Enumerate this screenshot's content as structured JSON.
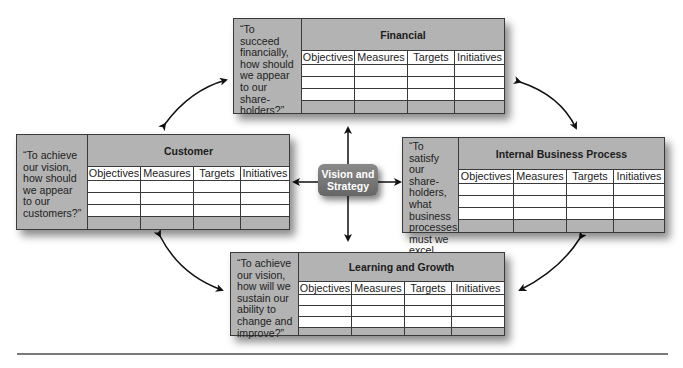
{
  "diagram": {
    "type": "balanced-scorecard",
    "center": {
      "label_line1": "Vision and",
      "label_line2": "Strategy"
    },
    "columns": [
      "Objectives",
      "Measures",
      "Targets",
      "Initiatives"
    ],
    "perspectives": [
      {
        "id": "financial",
        "title": "Financial",
        "quote": "“To succeed financially, how should we appear to our share-holders?”"
      },
      {
        "id": "customer",
        "title": "Customer",
        "quote": "“To achieve our vision, how should we appear to our customers?”"
      },
      {
        "id": "internal",
        "title": "Internal Business Process",
        "quote": "“To satisfy our share-holders, what business processes must we excel at?”"
      },
      {
        "id": "learning",
        "title": "Learning and Growth",
        "quote": "“To achieve our vision, how will we sustain our ability to change and improve?”"
      }
    ],
    "colors": {
      "box_fill": "#b3b3b3",
      "border": "#3a3a3a",
      "center_fill": "#777777",
      "arrow": "#111111"
    }
  }
}
